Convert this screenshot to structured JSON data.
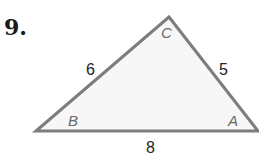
{
  "problem": {
    "number": "9."
  },
  "triangle": {
    "vertices": [
      {
        "label": "B",
        "x": 36,
        "y": 131
      },
      {
        "label": "C",
        "x": 169,
        "y": 17
      },
      {
        "label": "A",
        "x": 258,
        "y": 131
      }
    ],
    "sides": [
      {
        "between": "B-C",
        "length": "6"
      },
      {
        "between": "C-A",
        "length": "5"
      },
      {
        "between": "B-A",
        "length": "8"
      }
    ],
    "stroke_color": "#7d7d7d",
    "fill_color": "#f7f7f7"
  }
}
